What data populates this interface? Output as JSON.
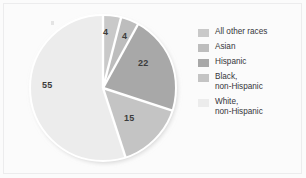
{
  "chart_data": {
    "type": "pie",
    "title": "",
    "subtitle": "",
    "xlabel": "",
    "ylabel": "",
    "legend_position": "right",
    "grid": false,
    "units": "percent",
    "categories": [
      "All other races",
      "Asian",
      "Hispanic",
      "Black, non-Hispanic",
      "White, non-Hispanic"
    ],
    "values": [
      4,
      4,
      22,
      15,
      55
    ],
    "labels": [
      "4",
      "4",
      "22",
      "15",
      "55"
    ],
    "colors": [
      "#c9c9c9",
      "#bdbdbd",
      "#a8a8a8",
      "#c4c4c4",
      "#ececec"
    ],
    "slice_separator_color": "#ffffff",
    "start_angle_deg": 0,
    "direction": "clockwise",
    "slices": [
      {
        "name": "All other races",
        "value": 4,
        "label": "4",
        "color": "#c9c9c9",
        "label_x": 105,
        "label_y": 32
      },
      {
        "name": "Asian",
        "value": 4,
        "label": "4",
        "color": "#bdbdbd",
        "label_x": 124,
        "label_y": 35
      },
      {
        "name": "Hispanic",
        "value": 22,
        "label": "22",
        "color": "#a8a8a8",
        "label_x": 140,
        "label_y": 62
      },
      {
        "name": "Black, non-Hispanic",
        "value": 15,
        "label": "15",
        "color": "#c4c4c4",
        "label_x": 126,
        "label_y": 117
      },
      {
        "name": "White, non-Hispanic",
        "value": 55,
        "label": "55",
        "color": "#ececec",
        "label_x": 44,
        "label_y": 82
      }
    ]
  },
  "legend": {
    "items": [
      {
        "label": "All other races",
        "color": "#c9c9c9"
      },
      {
        "label": "Asian",
        "color": "#bdbdbd"
      },
      {
        "label": "Hispanic",
        "color": "#a8a8a8"
      },
      {
        "label": "Black,\nnon-Hispanic",
        "color": "#c4c4c4"
      },
      {
        "label": "White,\nnon-Hispanic",
        "color": "#ececec"
      }
    ]
  },
  "theme": {
    "background": "#fbfbfb",
    "frame_border": "#ececed",
    "label_text": "#3c3c3c",
    "legend_text": "#35353a"
  }
}
